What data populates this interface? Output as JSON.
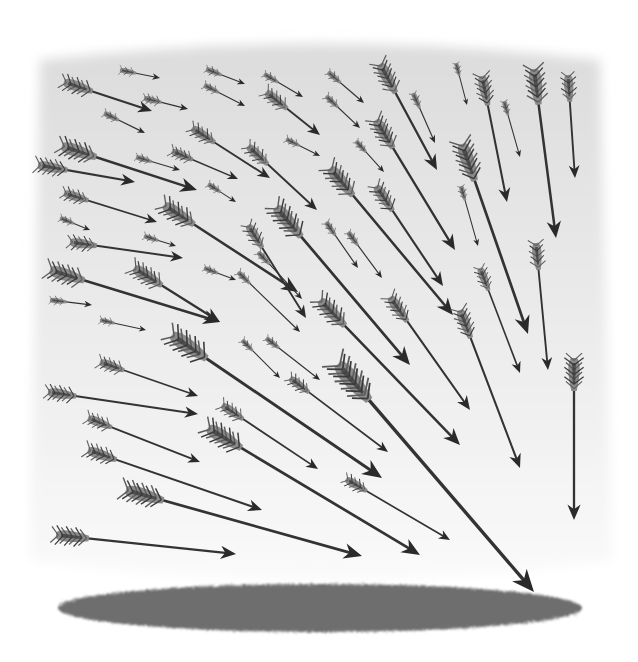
{
  "illustration": {
    "title": "Volley of arrows converging on the ground",
    "colors": {
      "page": "#ffffff",
      "sky_top": "#dcdcdc",
      "sky_bottom": "#fafafa",
      "shaft": "#333333",
      "head": "#2a2a2a",
      "fletch_light": "#8a8a8a",
      "fletch_dark": "#3a3a3a",
      "ground": "#6e6e6e"
    },
    "ground": {
      "cx": 320,
      "cy": 608,
      "rx": 262,
      "ry": 24
    },
    "arrows": [
      {
        "tail": [
          64,
          82
        ],
        "tip": [
          152,
          111
        ],
        "s": 1.0
      },
      {
        "tail": [
          120,
          70
        ],
        "tip": [
          160,
          78
        ],
        "s": 0.55
      },
      {
        "tail": [
          144,
          98
        ],
        "tip": [
          188,
          109
        ],
        "s": 0.6
      },
      {
        "tail": [
          104,
          113
        ],
        "tip": [
          145,
          133
        ],
        "s": 0.55
      },
      {
        "tail": [
          206,
          69
        ],
        "tip": [
          245,
          84
        ],
        "s": 0.55
      },
      {
        "tail": [
          204,
          85
        ],
        "tip": [
          245,
          106
        ],
        "s": 0.55
      },
      {
        "tail": [
          264,
          74
        ],
        "tip": [
          303,
          97
        ],
        "s": 0.55
      },
      {
        "tail": [
          266,
          92
        ],
        "tip": [
          320,
          135
        ],
        "s": 0.9
      },
      {
        "tail": [
          62,
          146
        ],
        "tip": [
          197,
          190
        ],
        "s": 1.2
      },
      {
        "tail": [
          38,
          165
        ],
        "tip": [
          135,
          182
        ],
        "s": 1.0
      },
      {
        "tail": [
          136,
          157
        ],
        "tip": [
          180,
          170
        ],
        "s": 0.55
      },
      {
        "tail": [
          172,
          151
        ],
        "tip": [
          238,
          179
        ],
        "s": 0.75
      },
      {
        "tail": [
          192,
          128
        ],
        "tip": [
          270,
          178
        ],
        "s": 0.9
      },
      {
        "tail": [
          208,
          184
        ],
        "tip": [
          236,
          202
        ],
        "s": 0.5
      },
      {
        "tail": [
          248,
          146
        ],
        "tip": [
          317,
          210
        ],
        "s": 0.9
      },
      {
        "tail": [
          286,
          139
        ],
        "tip": [
          320,
          156
        ],
        "s": 0.5
      },
      {
        "tail": [
          328,
          72
        ],
        "tip": [
          364,
          103
        ],
        "s": 0.55
      },
      {
        "tail": [
          326,
          96
        ],
        "tip": [
          360,
          128
        ],
        "s": 0.55
      },
      {
        "tail": [
          356,
          141
        ],
        "tip": [
          384,
          172
        ],
        "s": 0.5
      },
      {
        "tail": [
          380,
          64
        ],
        "tip": [
          437,
          170
        ],
        "s": 1.1
      },
      {
        "tail": [
          413,
          93
        ],
        "tip": [
          435,
          143
        ],
        "s": 0.55
      },
      {
        "tail": [
          376,
          120
        ],
        "tip": [
          455,
          250
        ],
        "s": 1.1
      },
      {
        "tail": [
          456,
          63
        ],
        "tip": [
          467,
          105
        ],
        "s": 0.45
      },
      {
        "tail": [
          482,
          76
        ],
        "tip": [
          507,
          202
        ],
        "s": 1.0
      },
      {
        "tail": [
          504,
          101
        ],
        "tip": [
          520,
          157
        ],
        "s": 0.5
      },
      {
        "tail": [
          534,
          69
        ],
        "tip": [
          556,
          238
        ],
        "s": 1.2
      },
      {
        "tail": [
          568,
          75
        ],
        "tip": [
          575,
          178
        ],
        "s": 0.9
      },
      {
        "tail": [
          462,
          144
        ],
        "tip": [
          528,
          334
        ],
        "s": 1.3
      },
      {
        "tail": [
          461,
          186
        ],
        "tip": [
          478,
          246
        ],
        "s": 0.5
      },
      {
        "tail": [
          536,
          243
        ],
        "tip": [
          548,
          370
        ],
        "s": 0.9
      },
      {
        "tail": [
          64,
          193
        ],
        "tip": [
          157,
          222
        ],
        "s": 0.85
      },
      {
        "tail": [
          60,
          218
        ],
        "tip": [
          90,
          230
        ],
        "s": 0.5
      },
      {
        "tail": [
          70,
          242
        ],
        "tip": [
          183,
          258
        ],
        "s": 0.9
      },
      {
        "tail": [
          144,
          236
        ],
        "tip": [
          176,
          246
        ],
        "s": 0.5
      },
      {
        "tail": [
          164,
          205
        ],
        "tip": [
          298,
          292
        ],
        "s": 1.2
      },
      {
        "tail": [
          50,
          270
        ],
        "tip": [
          220,
          322
        ],
        "s": 1.2
      },
      {
        "tail": [
          50,
          300
        ],
        "tip": [
          92,
          305
        ],
        "s": 0.55
      },
      {
        "tail": [
          134,
          268
        ],
        "tip": [
          220,
          322
        ],
        "s": 1.1
      },
      {
        "tail": [
          204,
          268
        ],
        "tip": [
          236,
          280
        ],
        "s": 0.5
      },
      {
        "tail": [
          100,
          320
        ],
        "tip": [
          146,
          330
        ],
        "s": 0.5
      },
      {
        "tail": [
          248,
          225
        ],
        "tip": [
          306,
          318
        ],
        "s": 0.9
      },
      {
        "tail": [
          258,
          252
        ],
        "tip": [
          302,
          299
        ],
        "s": 0.55
      },
      {
        "tail": [
          276,
          207
        ],
        "tip": [
          410,
          365
        ],
        "s": 1.3
      },
      {
        "tail": [
          326,
          222
        ],
        "tip": [
          358,
          268
        ],
        "s": 0.55
      },
      {
        "tail": [
          348,
          232
        ],
        "tip": [
          382,
          278
        ],
        "s": 0.55
      },
      {
        "tail": [
          330,
          168
        ],
        "tip": [
          453,
          315
        ],
        "s": 1.2
      },
      {
        "tail": [
          376,
          186
        ],
        "tip": [
          443,
          286
        ],
        "s": 1.0
      },
      {
        "tail": [
          238,
          272
        ],
        "tip": [
          300,
          332
        ],
        "s": 0.55
      },
      {
        "tail": [
          320,
          300
        ],
        "tip": [
          460,
          445
        ],
        "s": 1.2
      },
      {
        "tail": [
          390,
          297
        ],
        "tip": [
          470,
          410
        ],
        "s": 1.0
      },
      {
        "tail": [
          480,
          268
        ],
        "tip": [
          520,
          373
        ],
        "s": 0.8
      },
      {
        "tail": [
          460,
          310
        ],
        "tip": [
          520,
          468
        ],
        "s": 1.0
      },
      {
        "tail": [
          574,
          358
        ],
        "tip": [
          574,
          520
        ],
        "s": 1.1
      },
      {
        "tail": [
          242,
          340
        ],
        "tip": [
          280,
          378
        ],
        "s": 0.5
      },
      {
        "tail": [
          266,
          338
        ],
        "tip": [
          320,
          380
        ],
        "s": 0.55
      },
      {
        "tail": [
          100,
          362
        ],
        "tip": [
          198,
          396
        ],
        "s": 0.85
      },
      {
        "tail": [
          48,
          392
        ],
        "tip": [
          198,
          414
        ],
        "s": 0.95
      },
      {
        "tail": [
          88,
          418
        ],
        "tip": [
          200,
          462
        ],
        "s": 0.85
      },
      {
        "tail": [
          172,
          335
        ],
        "tip": [
          382,
          478
        ],
        "s": 1.4
      },
      {
        "tail": [
          222,
          405
        ],
        "tip": [
          318,
          469
        ],
        "s": 0.85
      },
      {
        "tail": [
          290,
          378
        ],
        "tip": [
          388,
          452
        ],
        "s": 0.8
      },
      {
        "tail": [
          88,
          450
        ],
        "tip": [
          262,
          510
        ],
        "s": 1.0
      },
      {
        "tail": [
          208,
          428
        ],
        "tip": [
          420,
          555
        ],
        "s": 1.3
      },
      {
        "tail": [
          126,
          490
        ],
        "tip": [
          362,
          556
        ],
        "s": 1.3
      },
      {
        "tail": [
          346,
          479
        ],
        "tip": [
          450,
          540
        ],
        "s": 0.8
      },
      {
        "tail": [
          338,
          364
        ],
        "tip": [
          534,
          592
        ],
        "s": 1.6
      },
      {
        "tail": [
          56,
          535
        ],
        "tip": [
          236,
          554
        ],
        "s": 1.1
      }
    ]
  }
}
